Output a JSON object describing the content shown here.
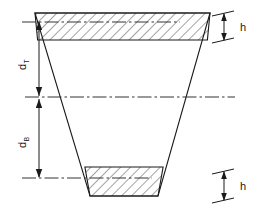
{
  "figure": {
    "labels": {
      "dim_top_main": "d",
      "dim_top_sub": "T",
      "dim_bottom_main": "d",
      "dim_bottom_sub": "B",
      "height_top": "h",
      "height_bottom": "h"
    },
    "colors": {
      "outline": "#1a1a1a",
      "hatch": "#1a1a1a",
      "centerline": "#333333",
      "dimension": "#1a1a1a",
      "background": "#ffffff"
    },
    "geometry": {
      "trapezoid": {
        "top_left_x": 35,
        "top_right_x": 210,
        "top_y": 13,
        "bottom_left_x": 90,
        "bottom_right_x": 158,
        "bottom_y": 196
      },
      "top_band": {
        "y_start": 13,
        "y_end": 40
      },
      "bottom_band": {
        "y_start": 167,
        "y_end": 196
      },
      "neutral_axis_y": 97,
      "top_datum_y": 22,
      "bottom_datum_y": 178,
      "dimension_line_x": 39
    }
  }
}
